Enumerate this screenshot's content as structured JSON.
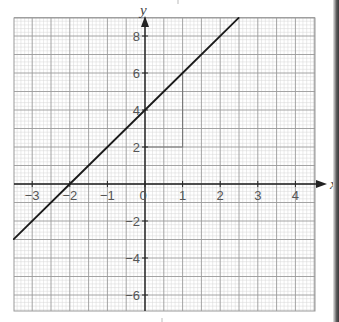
{
  "chart_data": {
    "type": "line",
    "title": "",
    "xlabel": "x",
    "ylabel": "y",
    "xlim": [
      -3.5,
      4.5
    ],
    "ylim": [
      -7,
      9
    ],
    "x_ticks": [
      -3,
      -2,
      -1,
      0,
      1,
      2,
      3,
      4
    ],
    "x_tick_labels": [
      "−3",
      "−2",
      "−1",
      "0",
      "1",
      "2",
      "3",
      "4"
    ],
    "y_ticks": [
      8,
      6,
      4,
      2,
      -2,
      -4,
      -6
    ],
    "y_tick_labels": [
      "8",
      "6",
      "4",
      "2",
      "−2",
      "−4",
      "−6"
    ],
    "grid": true,
    "grid_minor_x": 0.1,
    "grid_minor_y": 0.2,
    "grid_major_x": 0.5,
    "grid_major_y": 1,
    "legend": null,
    "series": [
      {
        "name": "y = 2x + 4",
        "equation": "y = 2x + 4",
        "x": [
          -3.49,
          -2,
          0,
          1,
          2.49
        ],
        "y": [
          -2.98,
          0,
          4,
          6,
          8.98
        ],
        "color": "#1a1a1a"
      }
    ],
    "annotations": [
      {
        "type": "slope-triangle",
        "description": "gradient triangle: run from (0,2) to (1,2), rise from (1,2) to (1,6)",
        "points": [
          [
            0,
            2
          ],
          [
            1,
            2
          ],
          [
            1,
            6
          ]
        ]
      }
    ]
  },
  "colors": {
    "paper": "#ffffff",
    "grid_minor": "#d6d6d6",
    "grid_major": "#9a9a9a",
    "axis": "#222222",
    "line": "#1a1a1a",
    "label": "#555555"
  }
}
